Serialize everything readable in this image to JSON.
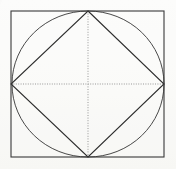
{
  "figure": {
    "title": "Square with inscribed circle and inscribed diamond",
    "background_color": "#fdfdfc",
    "canvas": {
      "width": 176,
      "height": 169
    },
    "stroke_colors": {
      "square": "#3a3a3a",
      "circle": "#4a4a4a",
      "diamond": "#2e2e2e",
      "construction": "#9a9a9a"
    },
    "shapes": {
      "square": {
        "name": "outer-square",
        "x": 11,
        "y": 11,
        "width": 153,
        "height": 146,
        "stroke_width": 1.1
      },
      "circle": {
        "name": "inscribed-circle",
        "cx": 88,
        "cy": 84,
        "rx": 76,
        "ry": 73,
        "stroke_width": 1
      },
      "diamond": {
        "name": "inscribed-diamond",
        "points": "88,11 164,84 88,157 11,84",
        "stroke_width": 1.1
      },
      "construction_lines": [
        {
          "name": "horizontal-median",
          "x1": 11,
          "y1": 84,
          "x2": 164,
          "y2": 84
        },
        {
          "name": "vertical-median",
          "x1": 88,
          "y1": 11,
          "x2": 88,
          "y2": 157
        }
      ]
    },
    "vertices": {
      "top": {
        "x": 88,
        "y": 11
      },
      "right": {
        "x": 164,
        "y": 84
      },
      "bottom": {
        "x": 88,
        "y": 157
      },
      "left": {
        "x": 11,
        "y": 84
      },
      "center": {
        "x": 88,
        "y": 84
      }
    },
    "labels": {
      "description": "Square with inscribed circle and inscribed diamond, dotted medians through center"
    }
  }
}
